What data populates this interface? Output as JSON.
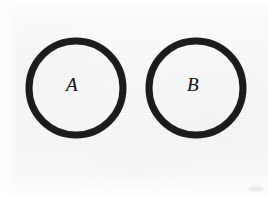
{
  "figure": {
    "background_color": "#f7f7f7",
    "ink_color": "#1d1d1d",
    "width": 268,
    "height": 197,
    "medium": "scanned book page"
  },
  "shapes": [
    {
      "id": "circle-a",
      "type": "circle",
      "label": "A",
      "center_x": 76,
      "center_y": 88,
      "radius": 47,
      "stroke_width": 7,
      "stroke_color": "#1d1d1d",
      "fill": "none"
    },
    {
      "id": "circle-b",
      "type": "circle",
      "label": "B",
      "center_x": 196,
      "center_y": 88,
      "radius": 47,
      "stroke_width": 7,
      "stroke_color": "#1d1d1d",
      "fill": "none"
    }
  ],
  "labels": {
    "circle_a": "A",
    "circle_b": "B"
  },
  "relationship": "disjoint"
}
